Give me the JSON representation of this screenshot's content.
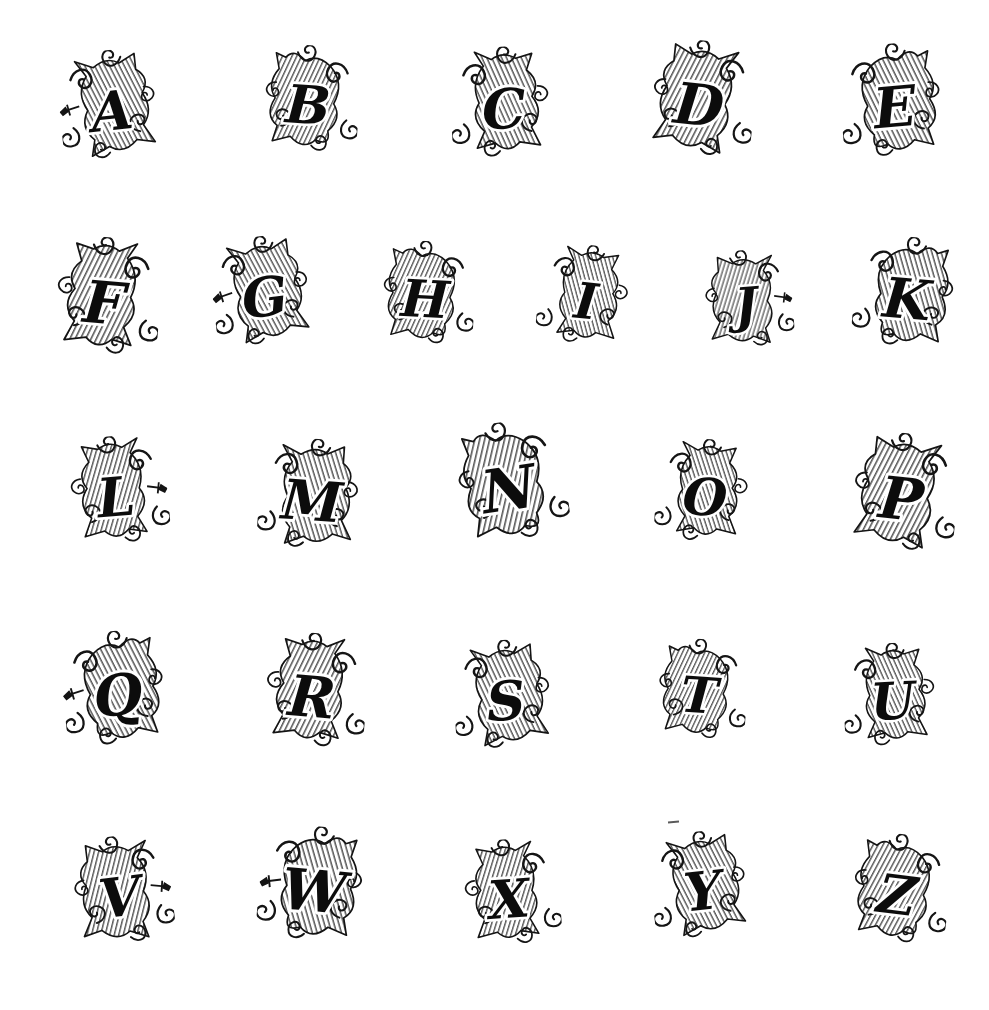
{
  "page": {
    "background_color": "#ffffff",
    "ink_color": "#141414",
    "hatch_color": "#2b2b2b"
  },
  "alphabet": {
    "rows": [
      {
        "letters": [
          "A",
          "B",
          "C",
          "D",
          "E"
        ]
      },
      {
        "letters": [
          "F",
          "G",
          "H",
          "I",
          "J",
          "K"
        ]
      },
      {
        "letters": [
          "L",
          "M",
          "N",
          "O",
          "P"
        ]
      },
      {
        "letters": [
          "Q",
          "R",
          "S",
          "T",
          "U"
        ]
      },
      {
        "letters": [
          "V",
          "W",
          "X",
          "Y",
          "Z"
        ]
      }
    ]
  },
  "artifacts": {
    "stray_mark_above_y": "small ink dash"
  }
}
